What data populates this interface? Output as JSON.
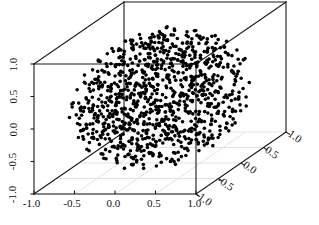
{
  "chart_data": {
    "type": "scatter",
    "projection": "3d",
    "title": "",
    "xlabel": "",
    "ylabel": "",
    "zlabel": "",
    "grid": true,
    "grid_face": "bottom",
    "legend": "none",
    "marker": {
      "shape": "circle",
      "color": "#000000",
      "size_px": 3.6,
      "filled": true
    },
    "point_count": 1000,
    "distribution": "uniform-in-unit-ball",
    "xlim": [
      -1.0,
      1.0
    ],
    "ylim": [
      -1.0,
      1.0
    ],
    "zlim": [
      -1.0,
      1.0
    ],
    "x_ticks": [
      "-1.0",
      "-0.5",
      "0.0",
      "0.5",
      "1.0"
    ],
    "x_tick_values": [
      -1.0,
      -0.5,
      0.0,
      0.5,
      1.0
    ],
    "y_ticks": [
      "-1.0",
      "-0.5",
      "0.0",
      "0.5",
      "1.0"
    ],
    "y_tick_values": [
      -1.0,
      -0.5,
      0.0,
      0.5,
      1.0
    ],
    "z_ticks": [
      "-1.0",
      "-0.5",
      "0.0",
      "0.5",
      "1.0"
    ],
    "z_tick_values": [
      -1.0,
      -0.5,
      0.0,
      0.5,
      1.0
    ],
    "box_color": "#1a1a1a",
    "grid_color": "#e0e0e0",
    "background": "#ffffff"
  },
  "axes": {
    "x": {
      "name": "x-axis",
      "ticks": [
        {
          "label": "-1.0",
          "px": 34
        },
        {
          "label": "-0.5",
          "px": 74.5
        },
        {
          "label": "0.0",
          "px": 115
        },
        {
          "label": "0.5",
          "px": 155.5
        },
        {
          "label": "1.0",
          "px": 196
        }
      ]
    },
    "z": {
      "name": "z-axis",
      "ticks": [
        {
          "label": "1.0",
          "px": 64
        },
        {
          "label": "0.5",
          "px": 96.5
        },
        {
          "label": "0.0",
          "px": 129
        },
        {
          "label": "-0.5",
          "px": 161.5
        },
        {
          "label": "-1.0",
          "px": 194
        }
      ]
    },
    "y": {
      "name": "y-depth-axis",
      "ticks": [
        {
          "label": "-1.0",
          "fx": 196,
          "fy": 194
        },
        {
          "label": "-0.5",
          "fx": 218.5,
          "fy": 178.5
        },
        {
          "label": "0.0",
          "fx": 241,
          "fy": 163
        },
        {
          "label": "0.5",
          "fx": 263.5,
          "fy": 147.5
        },
        {
          "label": "1.0",
          "fx": 286,
          "fy": 132
        }
      ]
    }
  }
}
